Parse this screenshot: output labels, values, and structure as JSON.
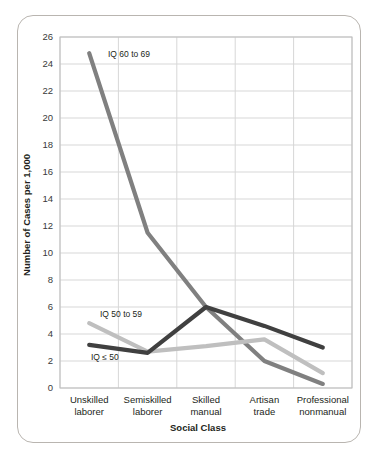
{
  "chart_data": {
    "type": "line",
    "title": "",
    "xlabel": "Social Class",
    "ylabel": "Number of Cases per 1,000",
    "categories": [
      "Unskilled laborer",
      "Semiskilled laborer",
      "Skilled manual",
      "Artisan trade",
      "Professional nonmanual"
    ],
    "category_lines": [
      [
        "Unskilled",
        "laborer"
      ],
      [
        "Semiskilled",
        "laborer"
      ],
      [
        "Skilled",
        "manual"
      ],
      [
        "Artisan",
        "trade"
      ],
      [
        "Professional",
        "nonmanual"
      ]
    ],
    "ylim": [
      0,
      26
    ],
    "yticks": [
      0,
      2,
      4,
      6,
      8,
      10,
      12,
      14,
      16,
      18,
      20,
      22,
      24,
      26
    ],
    "ytick_labels": [
      "0",
      "2",
      "4",
      "6",
      "8",
      "10",
      "12",
      "14",
      "16",
      "18",
      "20",
      "22",
      "24",
      "26"
    ],
    "grid": true,
    "legend": "inline-annotations",
    "series": [
      {
        "name": "IQ 60 to 69",
        "color": "#808080",
        "values": [
          24.8,
          11.5,
          6.0,
          2.0,
          0.3
        ]
      },
      {
        "name": "IQ 50 to 59",
        "color": "#bfbfbf",
        "values": [
          4.8,
          2.7,
          3.1,
          3.6,
          1.1
        ]
      },
      {
        "name": "IQ ≤ 50",
        "color": "#404040",
        "values": [
          3.2,
          2.6,
          6.0,
          4.6,
          3.0
        ]
      }
    ],
    "annotations": [
      {
        "text": "IQ 60 to 69",
        "x": 108,
        "y": 57
      },
      {
        "text": "IQ 50 to 59",
        "x": 100,
        "y": 317
      },
      {
        "text": "IQ ≤ 50",
        "x": 91,
        "y": 360
      }
    ]
  },
  "axis_titles": {
    "x": "Social Class",
    "y": "Number of Cases per 1,000"
  }
}
